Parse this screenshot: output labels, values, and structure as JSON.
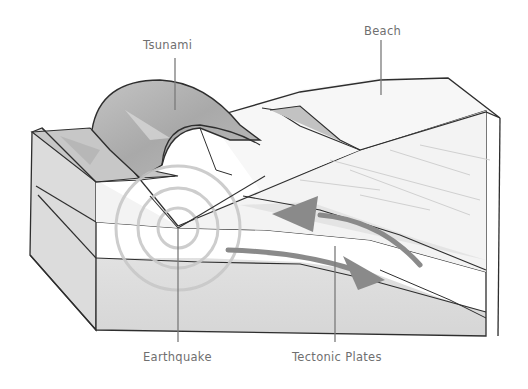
{
  "diagram": {
    "type": "illustrated-cross-section",
    "labels": {
      "tsunami": "Tsunami",
      "beach": "Beach",
      "earthquake": "Earthquake",
      "tectonic_plates": "Tectonic Plates"
    },
    "colors": {
      "outline": "#2e2e2e",
      "leader_line": "#7a7a7a",
      "label_text": "#6f6f6f",
      "wave_fill": "#b4b4b4",
      "arrow_fill": "#8a8a8a",
      "ground_fill": "#e4e4e4",
      "ripple": "#c8c8c8"
    }
  }
}
